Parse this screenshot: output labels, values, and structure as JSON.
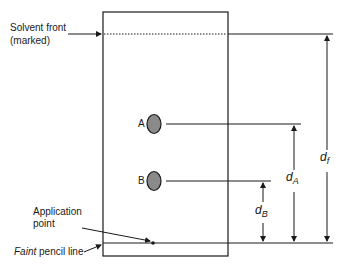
{
  "diagram": {
    "type": "thin-layer-chromatography-plate",
    "labels": {
      "solvent_front_line1": "Solvent front",
      "solvent_front_line2": "(marked)",
      "application_line1": "Application",
      "application_line2": "point",
      "faint": "Faint",
      "pencil_line": " pencil line",
      "spot_a": "A",
      "spot_b": "B"
    },
    "distances": {
      "d_f_main": "d",
      "d_f_sub": "f",
      "d_a_main": "d",
      "d_a_sub": "A",
      "d_b_main": "d",
      "d_b_sub": "B"
    },
    "colors": {
      "line": "#1a1a1a",
      "spot_fill": "#8a8a8a"
    }
  }
}
